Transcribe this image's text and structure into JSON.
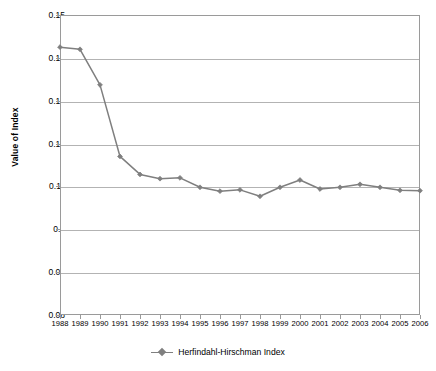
{
  "chart_data": {
    "type": "line",
    "title": "",
    "xlabel": "",
    "ylabel": "Value of Index",
    "ylim": [
      0.08,
      0.15
    ],
    "ytick_step": 0.01,
    "yticks": [
      "0.15",
      "0.14",
      "0.13",
      "0.12",
      "0.11",
      "0.1",
      "0.09",
      "0.08"
    ],
    "grid": true,
    "legend_position": "bottom-center",
    "categories": [
      "1988",
      "1989",
      "1990",
      "1991",
      "1992",
      "1993",
      "1994",
      "1995",
      "1996",
      "1997",
      "1998",
      "1999",
      "2000",
      "2001",
      "2002",
      "2003",
      "2004",
      "2005",
      "2006"
    ],
    "series": [
      {
        "name": "Herfindahl-Hirschman Index",
        "color": "#7f7f7f",
        "marker": "diamond",
        "values": [
          0.1425,
          0.142,
          0.1337,
          0.117,
          0.1128,
          0.1118,
          0.112,
          0.1098,
          0.1089,
          0.1092,
          0.1077,
          0.1098,
          0.1115,
          0.1094,
          0.1098,
          0.1105,
          0.1098,
          0.1091,
          0.109
        ]
      }
    ]
  },
  "legend": {
    "entries": [
      {
        "label": "Herfindahl-Hirschman Index",
        "marker": "diamond-line-marker"
      }
    ]
  },
  "axes": {
    "y_title": "Value of Index"
  }
}
